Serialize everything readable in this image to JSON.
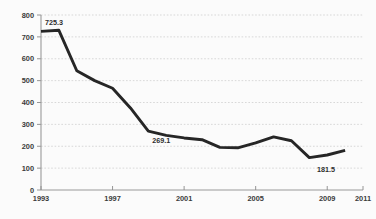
{
  "chart_data": {
    "type": "line",
    "title": "",
    "subtitle": "",
    "xlabel": "",
    "ylabel": "",
    "grid": true,
    "legend_position": "none",
    "xlim": [
      1993,
      2011
    ],
    "ylim": [
      0,
      800
    ],
    "x_ticks": [
      "1993",
      "1997",
      "2001",
      "2005",
      "2009",
      "2011"
    ],
    "x_tick_values": [
      1993,
      1997,
      2001,
      2005,
      2009,
      2011
    ],
    "y_ticks": [
      "0",
      "100",
      "200",
      "300",
      "400",
      "500",
      "600",
      "700",
      "800"
    ],
    "y_tick_values": [
      0,
      100,
      200,
      300,
      400,
      500,
      600,
      700,
      800
    ],
    "x": [
      1993,
      1994,
      1995,
      1996,
      1997,
      1998,
      1999,
      2000,
      2001,
      2002,
      2003,
      2004,
      2005,
      2006,
      2007,
      2008,
      2009,
      2010
    ],
    "values": [
      725.3,
      730.0,
      545.0,
      500.0,
      465.0,
      375.0,
      269.1,
      250.0,
      238.0,
      230.0,
      195.0,
      193.0,
      215.0,
      243.0,
      225.0,
      148.0,
      160.0,
      181.5
    ],
    "series": [
      {
        "name": "series-1",
        "values": [
          725.3,
          730.0,
          545.0,
          500.0,
          465.0,
          375.0,
          269.1,
          250.0,
          238.0,
          230.0,
          195.0,
          193.0,
          215.0,
          243.0,
          225.0,
          148.0,
          160.0,
          181.5
        ]
      }
    ],
    "annotations": [
      {
        "id": "first-point-label",
        "text": "725.3",
        "x": 1993,
        "y": 725.3
      },
      {
        "id": "mid-point-label",
        "text": "269.1",
        "x": 1999,
        "y": 269.1
      },
      {
        "id": "last-point-label",
        "text": "181.5",
        "x": 2010,
        "y": 181.5
      }
    ],
    "colors": {
      "line": "#262626",
      "grid": "#c9c9c9",
      "axis": "#9a9a9a",
      "background": "#fbfbfb",
      "tick_text": "#3a3a3a",
      "label_text": "#2e2e2e"
    }
  }
}
